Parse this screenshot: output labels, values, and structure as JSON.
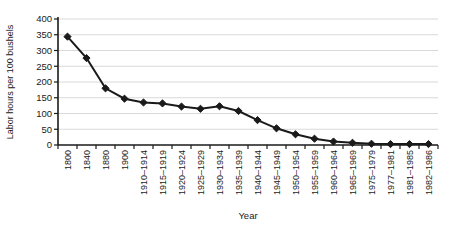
{
  "figure": {
    "background_color": "#ffffff"
  },
  "chart_data": {
    "type": "line",
    "title": "",
    "xlabel": "Year",
    "ylabel": "Labor hours per 100 bushels",
    "categories": [
      "1800",
      "1840",
      "1880",
      "1900",
      "1910–1914",
      "1915–1919",
      "1920–1924",
      "1925–1929",
      "1930–1934",
      "1935–1939",
      "1940–1944",
      "1945–1949",
      "1950–1954",
      "1955–1959",
      "1960–1964",
      "1965–1969",
      "1975–1979",
      "1977–1981",
      "1981–1985",
      "1982–1986"
    ],
    "series": [
      {
        "name": "Labor hours per 100 bushels",
        "values": [
          344,
          276,
          180,
          147,
          135,
          132,
          122,
          115,
          123,
          108,
          79,
          53,
          34,
          20,
          11,
          7,
          4,
          3,
          3,
          3
        ]
      }
    ],
    "ylim": [
      0,
      400
    ],
    "yticks": [
      0,
      50,
      100,
      150,
      200,
      250,
      300,
      350,
      400
    ],
    "grid": "horizontal",
    "legend_position": "none",
    "marker": "diamond",
    "line_color": "#1a1a1a",
    "marker_color": "#1a1a1a",
    "axis_color": "#1a1a1a",
    "grid_color": "#d9d9d9",
    "text_color": "#1a1a1a"
  }
}
